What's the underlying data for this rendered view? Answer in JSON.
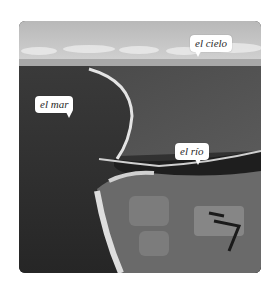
{
  "image": {
    "description": "Aerial photograph of a coastline where a river meets the sea, with sky and clouds on the horizon",
    "colors": {
      "sky": "#c8c8c8",
      "clouds": "#e6e6e6",
      "sea": "#2e2e2e",
      "land": "#555555",
      "beach": "#dcdcdc",
      "river": "#1e1e1e"
    }
  },
  "labels": {
    "sky": "el cielo",
    "sea": "el mar",
    "river": "el río"
  }
}
